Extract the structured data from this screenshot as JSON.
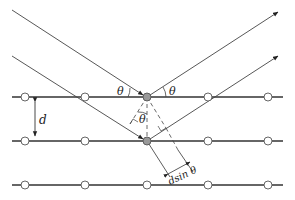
{
  "diagram": {
    "labels": {
      "theta_incident": "θ",
      "theta_reflected": "θ",
      "theta_inner": "θ",
      "spacing": "d",
      "path_difference": "dsin θ"
    },
    "lattice_planes": [
      97,
      141,
      185
    ],
    "atom_x": [
      25,
      85,
      147,
      208,
      268
    ],
    "scattering_atom_color": "#999999",
    "line_color": "#333333"
  }
}
